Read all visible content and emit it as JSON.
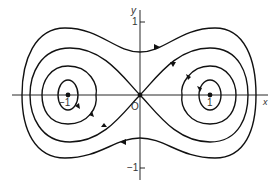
{
  "diagram": {
    "type": "phase-portrait",
    "axes": {
      "x_label": "x",
      "y_label": "y"
    },
    "ticks": {
      "y_pos": "1",
      "y_neg": "−1",
      "x_neg": "−1",
      "x_pos": "1",
      "origin": "O"
    },
    "equilibria": [
      {
        "name": "center-left",
        "x": -1,
        "y": 0
      },
      {
        "name": "saddle-origin",
        "x": 0,
        "y": 0
      },
      {
        "name": "center-right",
        "x": 1,
        "y": 0
      }
    ],
    "orbits": [
      "inner-cycle-left",
      "inner-cycle-right",
      "homoclinic-separatrix",
      "outer-cycle-1",
      "outer-cycle-2"
    ],
    "colors": {
      "stroke": "#111111",
      "background": "#ffffff"
    }
  }
}
